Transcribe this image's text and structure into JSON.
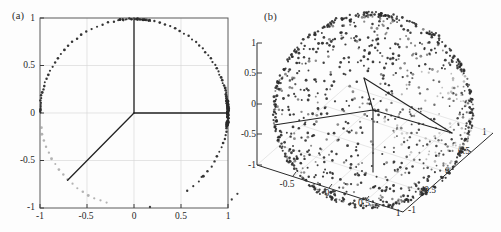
{
  "figure": {
    "background": "#fdfdfd",
    "panel_a_label": "(a)",
    "panel_b_label": "(b)"
  },
  "chart_data": [
    {
      "type": "scatter",
      "title": "(a)",
      "subtitle": "",
      "xlabel": "",
      "ylabel": "",
      "xlim": [
        -1,
        1
      ],
      "ylim": [
        -1,
        1
      ],
      "xticks": [
        -1,
        -0.5,
        0,
        0.5,
        1
      ],
      "xticklabels": [
        "-1",
        "-0.5",
        "0",
        "0.5",
        "1"
      ],
      "yticks": [
        -1,
        -0.5,
        0,
        0.5,
        1
      ],
      "yticklabels": [
        "-1",
        "-0.5",
        "0",
        "0.5",
        "1"
      ],
      "grid": true,
      "legend": null,
      "annotations": [
        {
          "name": "radius-line-up",
          "from": [
            0,
            0
          ],
          "to": [
            0,
            1
          ],
          "color": "#232323"
        },
        {
          "name": "radius-line-right",
          "from": [
            0,
            0
          ],
          "to": [
            1,
            0
          ],
          "color": "#232323"
        },
        {
          "name": "radius-line-lower-left",
          "from": [
            0,
            0
          ],
          "to": [
            -0.707,
            -0.707
          ],
          "color": "#232323"
        }
      ],
      "description": "Unit circle with sample points lying on the circumference; dense cluster of points near (1,0); lighter gray points along the lower-left arc.",
      "marker_color_dark": "#2a2a2a",
      "marker_color_light": "#9a9a9a",
      "points_polar_deg": [
        0,
        0.6,
        1.2,
        1.8,
        2.4,
        3,
        3.6,
        4.2,
        5,
        5.8,
        6.5,
        7.4,
        8.2,
        9,
        10.2,
        11.4,
        12.6,
        14,
        15.4,
        17,
        18.6,
        20.4,
        22.2,
        24.2,
        26.2,
        28.4,
        30.6,
        33,
        35.4,
        37.9,
        40.5,
        43.2,
        46,
        48.8,
        51.7,
        54.7,
        57.8,
        60.9,
        64.1,
        67.4,
        70.7,
        74.1,
        77.5,
        81,
        84.5,
        88,
        91.6,
        95.2,
        98.8,
        102.4,
        106,
        109.6,
        113.2,
        116.8,
        120.4,
        124,
        127.5,
        131,
        134.4,
        137.8,
        141.1,
        144.3,
        147.4,
        150.4,
        153.3,
        156,
        158.6,
        161,
        163.3,
        165.4,
        167.4,
        169.2,
        170.9,
        172.4,
        173.8,
        175.1,
        176.2,
        177.2,
        178.1,
        178.9,
        179.6,
        189,
        193,
        197,
        201,
        205,
        209,
        213,
        217,
        221,
        225,
        229,
        233,
        237,
        241,
        245,
        249,
        253,
        -2,
        -3.2,
        -4.5,
        -6,
        -7.6,
        -9.4,
        -11.4,
        -13.6,
        -16,
        -18.6,
        -21.4,
        -24.4,
        -27.6,
        -31,
        -34.6,
        -38.4,
        -42.4,
        -46.6,
        -51,
        -55.6,
        -0.4,
        -0.8,
        -1.2,
        -1.6,
        0.4,
        0.8,
        1.6,
        2.6,
        3.8
      ],
      "outlier_points": [
        {
          "x": 0.72,
          "y": -0.68
        },
        {
          "x": 0.17,
          "y": -1.0
        },
        {
          "x": 1.04,
          "y": -0.92
        },
        {
          "x": 1.1,
          "y": -0.86
        }
      ]
    },
    {
      "type": "scatter3d",
      "title": "(b)",
      "subtitle": "",
      "xlabel": "",
      "ylabel": "",
      "zlabel": "",
      "xlim": [
        -1,
        1
      ],
      "ylim": [
        -1,
        1
      ],
      "zlim": [
        -1,
        1
      ],
      "xticks": [
        -1,
        -0.5,
        0,
        0.5,
        1
      ],
      "xticklabels": [
        "-1",
        "-0.5",
        "0",
        "0.5",
        "1"
      ],
      "yticks": [
        -1,
        -0.5,
        0,
        0.5,
        1
      ],
      "yticklabels": [
        "-1",
        "-0.5",
        "0",
        "0.5",
        "1"
      ],
      "zticks": [
        -1,
        -0.5,
        0,
        0.5,
        1
      ],
      "zticklabels": [
        "-1",
        "-0.5",
        "0",
        "0.5",
        "1"
      ],
      "grid": true,
      "legend": null,
      "n_points": 1100,
      "marker_color_dark": "#2b2b2b",
      "marker_color_light": "#a8a8a8",
      "description": "Unit sphere with sample points distributed over its surface; denser, lighter-shaded cluster on the right/front-lower region; 3D box floor grid and three internal axis vectors from the sphere centre.",
      "annotations": [
        {
          "name": "axis-vector-z",
          "from": [
            0,
            0,
            0
          ],
          "to": [
            0,
            0,
            -1
          ]
        },
        {
          "name": "axis-vector-x",
          "from": [
            0,
            0,
            0
          ],
          "to": [
            -1,
            0,
            0
          ]
        },
        {
          "name": "axis-vector-y",
          "from": [
            0,
            0,
            0
          ],
          "to": [
            0,
            1,
            0
          ]
        },
        {
          "name": "axis-vector-diag",
          "from": [
            0,
            0,
            0
          ],
          "to": [
            0.6,
            0.3,
            0.4
          ]
        }
      ]
    }
  ]
}
